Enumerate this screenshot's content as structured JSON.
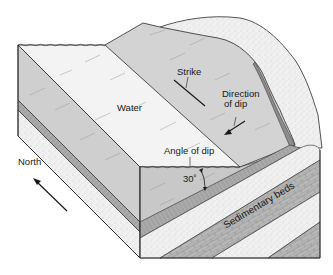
{
  "diagram": {
    "type": "block-diagram",
    "labels": {
      "water": "Water",
      "strike": "Strike",
      "direction_of_dip_line1": "Direction",
      "direction_of_dip_line2": "of dip",
      "angle_of_dip": "Angle of dip",
      "angle_value": "30˚",
      "north": "North",
      "sedimentary_beds": "Sedimentary beds"
    },
    "colors": {
      "outline": "#2a2a2a",
      "water_surface": "#f2f2f2",
      "exposed_bed": "#d2d2d2",
      "water_side": "#c9c9c9",
      "sand_bed": "#efefef",
      "brick_bed": "#b8b8b8",
      "shale_bed": "#a9a9a9"
    }
  }
}
